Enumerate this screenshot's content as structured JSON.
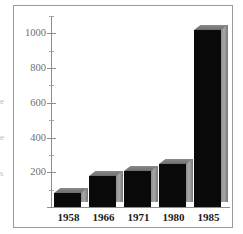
{
  "figure": {
    "background_color": "#ffffff",
    "frame_color": "#9a9a9a",
    "axis_color": "#8d8d8d"
  },
  "margin_fragments": [
    {
      "text": "e",
      "top": 96
    },
    {
      "text": "e",
      "top": 132
    },
    {
      "text": "s",
      "top": 168
    }
  ],
  "chart_data": {
    "type": "bar",
    "title": "",
    "subtitle": "",
    "xlabel": "",
    "ylabel": "",
    "categories": [
      "1958",
      "1966",
      "1971",
      "1980",
      "1985"
    ],
    "values": [
      80,
      180,
      205,
      250,
      1020
    ],
    "series": [
      {
        "name": "",
        "values": [
          80,
          180,
          205,
          250,
          1020
        ]
      }
    ],
    "ylim": [
      0,
      1100
    ],
    "xlim": [
      0,
      5
    ],
    "ytick_labels": [
      "200",
      "400",
      "600",
      "800",
      "1000"
    ],
    "ytick_values": [
      200,
      400,
      600,
      800,
      1000
    ],
    "yticks_minor": [
      100,
      300,
      500,
      700,
      900,
      1100
    ],
    "grid": false,
    "legend": null,
    "legend_position": "none",
    "bar_style": "3d-block",
    "bar_front_color": "#090909",
    "bar_side_color": "#a8a8a8",
    "bar_top_color": "#7d7d7d",
    "annotations": []
  },
  "axis": {
    "y_label_color": "#6f6f6f",
    "x_label_color": "#1a1a1a"
  }
}
